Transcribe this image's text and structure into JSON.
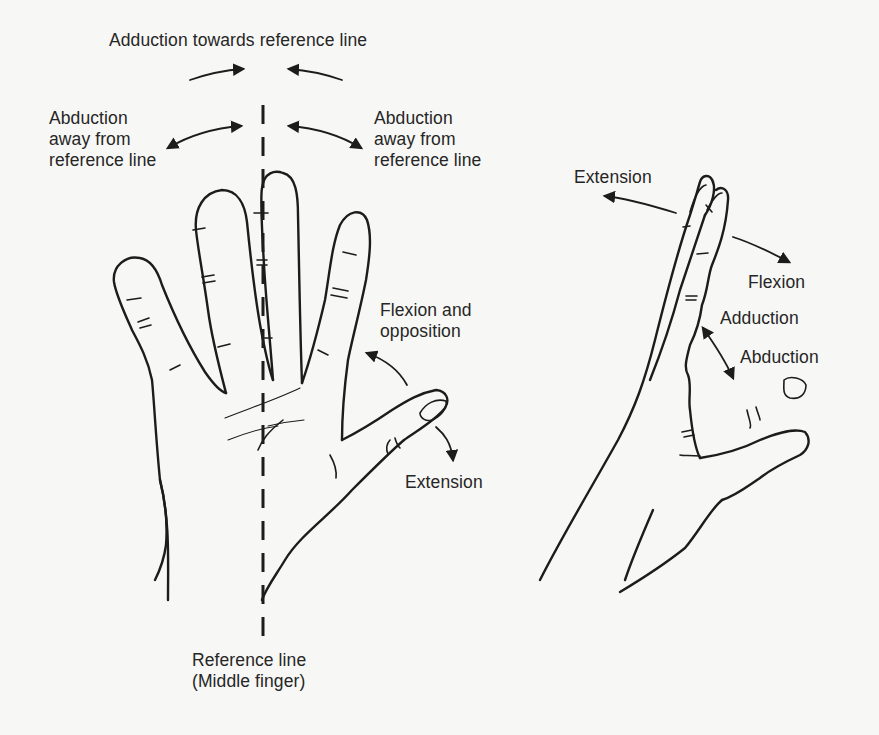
{
  "figure": {
    "background": "#f7f7f5",
    "ink": "#1c1c1c"
  },
  "labels": {
    "adduction_towards": "Adduction towards reference line",
    "abduction_left": [
      "Abduction",
      "away from",
      "reference line"
    ],
    "abduction_right": [
      "Abduction",
      "away from",
      "reference line"
    ],
    "flexion_opposition": [
      "Flexion and",
      "opposition"
    ],
    "extension_palm": "Extension",
    "reference_line": [
      "Reference line",
      "(Middle finger)"
    ],
    "extension_side": "Extension",
    "flexion_side": "Flexion",
    "adduction_side": "Adduction",
    "abduction_side": "Abduction"
  },
  "icons": {
    "palm_view_hand": "hand-palm-icon",
    "side_view_hand": "hand-side-icon",
    "reference_line": "dashed-line-icon"
  }
}
